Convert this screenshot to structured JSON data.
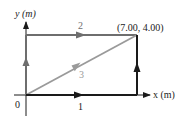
{
  "diagram": {
    "title": "",
    "axes": {
      "x_label": "x (m)",
      "y_label": "y (m)",
      "origin_label": "0"
    },
    "point_label": "(7.00, 4.00)",
    "endpoint": {
      "x": 7.0,
      "y": 4.0,
      "unit": "m"
    },
    "paths": [
      {
        "id": "1",
        "label": "1",
        "description": "along x-axis then up",
        "color": "#1a1a1a"
      },
      {
        "id": "2",
        "label": "2",
        "description": "up y-axis then along top",
        "color": "#6e6e6e"
      },
      {
        "id": "3",
        "label": "3",
        "description": "straight diagonal",
        "color": "#9a9a9a"
      }
    ],
    "colors": {
      "axis": "#1a1a1a",
      "dark_path": "#1a1a1a",
      "gray_path": "#6e6e6e",
      "light_path": "#9a9a9a"
    }
  }
}
